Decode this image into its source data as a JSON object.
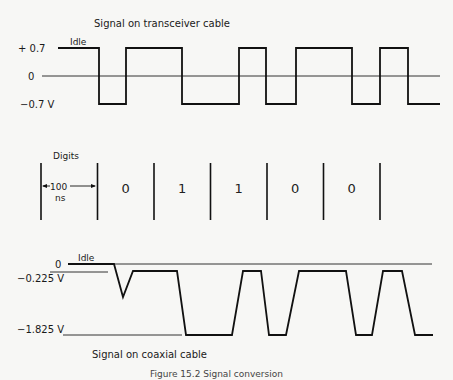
{
  "top_panel": {
    "title": "Signal on transceiver cable",
    "idle_label": "Idle",
    "y_labels": {
      "high": "+ 0.7",
      "zero": "0",
      "low": "−0.7 V"
    },
    "levels_volts": {
      "high": 0.7,
      "zero": 0,
      "low": -0.7
    },
    "bit_period_ns": 100
  },
  "digits_panel": {
    "title": "Digits",
    "period_label_value": "100",
    "period_label_unit": "ns",
    "digits": [
      "1",
      "0",
      "1",
      "1",
      "0",
      "0"
    ]
  },
  "bottom_panel": {
    "title": "Signal on coaxial cable",
    "idle_label": "Idle",
    "y_labels": {
      "zero": "0",
      "high": "−0.225 V",
      "low": "−1.825 V"
    },
    "levels_volts": {
      "zero": 0,
      "high": -0.225,
      "low": -1.825
    }
  },
  "caption": "Figure 15.2  Signal conversion"
}
